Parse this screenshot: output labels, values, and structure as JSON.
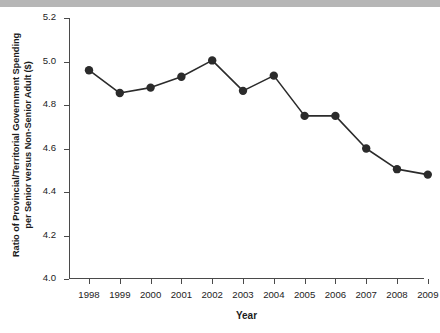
{
  "chart_data": {
    "type": "line",
    "title": "",
    "xlabel": "Year",
    "ylabel": "Ratio of Provincial/Territorial Government Spending per Senior versus Non-Senior Adult ($)",
    "ylabel_line1": "Ratio of Provincial/Territorial Government Spending",
    "ylabel_line2": "per Senior versus Non-Senior Adult ($)",
    "categories": [
      "1998",
      "1999",
      "2000",
      "2001",
      "2002",
      "2003",
      "2004",
      "2005",
      "2006",
      "2007",
      "2008",
      "2009"
    ],
    "values": [
      4.96,
      4.855,
      4.88,
      4.93,
      5.005,
      4.865,
      4.935,
      4.75,
      4.75,
      4.6,
      4.505,
      4.48
    ],
    "x": [
      1998,
      1999,
      2000,
      2001,
      2002,
      2003,
      2004,
      2005,
      2006,
      2007,
      2008,
      2009
    ],
    "ylim": [
      4.0,
      5.2
    ],
    "yticks": [
      "4.0",
      "4.2",
      "4.4",
      "4.6",
      "4.8",
      "5.0",
      "5.2"
    ],
    "ytick_values": [
      4.0,
      4.2,
      4.4,
      4.6,
      4.8,
      5.0,
      5.2
    ],
    "xticks": [
      "1998",
      "1999",
      "2000",
      "2001",
      "2002",
      "2003",
      "2004",
      "2005",
      "2006",
      "2007",
      "2008",
      "2009"
    ],
    "grid": false,
    "legend": "none",
    "series": [
      {
        "name": "Ratio of spending per senior versus non-senior adult",
        "values": [
          4.96,
          4.855,
          4.88,
          4.93,
          5.005,
          4.865,
          4.935,
          4.75,
          4.75,
          4.6,
          4.505,
          4.48
        ]
      }
    ],
    "marker": "circle",
    "marker_color": "#2b2b2b",
    "line_color": "#2b2b2b",
    "axis_color": "#4a4a4a",
    "background_color": "#ffffff"
  }
}
